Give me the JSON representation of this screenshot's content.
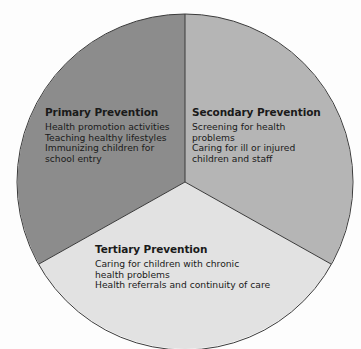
{
  "diagram": {
    "type": "pie-segments",
    "colors": {
      "primary": "#8c8c8c",
      "secondary": "#b5b5b5",
      "tertiary": "#e2e2e2",
      "outline": "#3a3a3a"
    },
    "segments": [
      {
        "title": "Primary Prevention",
        "items": [
          [
            "Health promotion activities"
          ],
          [
            "Teaching healthy lifestyles"
          ],
          [
            "Immunizing children for",
            "school entry"
          ]
        ]
      },
      {
        "title": "Secondary Prevention",
        "items": [
          [
            "Screening for health",
            "problems"
          ],
          [
            "Caring for ill or injured",
            "children and staff"
          ]
        ]
      },
      {
        "title": "Tertiary Prevention",
        "items": [
          [
            "Caring for children with chronic",
            "health problems"
          ],
          [
            "Health referrals and continuity of care"
          ]
        ]
      }
    ]
  }
}
